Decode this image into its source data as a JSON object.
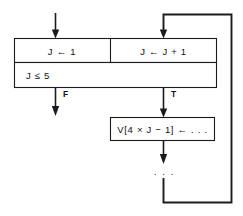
{
  "diagram": {
    "background_color": "#ffffff",
    "line_color": "#1b1b1b",
    "text_color": "#111111",
    "nodes": {
      "init": {
        "label": "J ← 1"
      },
      "increment": {
        "label": "J ← J + 1"
      },
      "condition": {
        "label": "J ≤ 5"
      },
      "body": {
        "label": "V[4 × J − 1] ← . . ."
      },
      "continuation": {
        "label": ". . ."
      }
    },
    "branches": {
      "false_label": "F",
      "true_label": "T"
    },
    "edges": [
      {
        "name": "entry-arrow",
        "from": "external",
        "to": "init"
      },
      {
        "name": "false-exit-arrow",
        "from": "condition",
        "to": "external",
        "label": "F"
      },
      {
        "name": "true-exit-arrow",
        "from": "condition",
        "to": "body",
        "label": "T"
      },
      {
        "name": "body-to-continuation-arrow",
        "from": "body",
        "to": "continuation"
      },
      {
        "name": "loop-back-edge",
        "from": "continuation",
        "to": "increment"
      },
      {
        "name": "increment-entry-arrow",
        "from": "loop-back-edge",
        "to": "increment"
      }
    ]
  }
}
